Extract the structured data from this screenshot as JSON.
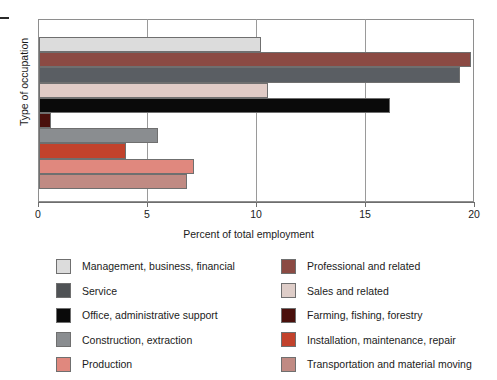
{
  "chart_data": {
    "type": "bar",
    "orientation": "horizontal",
    "title": "",
    "xlabel": "Percent of total employment",
    "ylabel": "Type of occupation",
    "xlim": [
      0,
      20
    ],
    "xticks": [
      "0",
      "5",
      "10",
      "15",
      "20"
    ],
    "grid": true,
    "grid_axis": "x",
    "legend_position": "bottom",
    "categories": [
      "Management, business, financial",
      "Professional and related",
      "Service",
      "Sales and related",
      "Office, administrative support",
      "Farming, fishing, forestry",
      "Construction, extraction",
      "Installation, maintenance, repair",
      "Production",
      "Transportation and material moving"
    ],
    "values": [
      10.2,
      19.8,
      19.3,
      10.5,
      16.1,
      0.55,
      5.45,
      4.0,
      7.1,
      6.8
    ],
    "colors": [
      "#dcdcdc",
      "#8b4a43",
      "#5a5e63",
      "#e0cbc6",
      "#0a0a0a",
      "#4a100c",
      "#8a8d90",
      "#c2422c",
      "#e0887e",
      "#c08a83"
    ]
  },
  "axes": {
    "x_title": "Percent of total employment",
    "y_title": "Type of occupation",
    "ticks": [
      {
        "label": "0",
        "value": 0
      },
      {
        "label": "5",
        "value": 5
      },
      {
        "label": "10",
        "value": 10
      },
      {
        "label": "15",
        "value": 15
      },
      {
        "label": "20",
        "value": 20
      }
    ]
  },
  "legend": {
    "columns": [
      {
        "items": [
          {
            "label": "Management, business, financial",
            "color": "#dcdcdc"
          },
          {
            "label": "Service",
            "color": "#4f5255"
          },
          {
            "label": "Office, administrative support",
            "color": "#0a0a0a"
          },
          {
            "label": "Construction, extraction",
            "color": "#8a8d90"
          },
          {
            "label": "Production",
            "color": "#e0887e"
          }
        ]
      },
      {
        "items": [
          {
            "label": "Professional and related",
            "color": "#8b4a43"
          },
          {
            "label": "Sales and related",
            "color": "#decdc8"
          },
          {
            "label": "Farming, fishing, forestry",
            "color": "#4a100c"
          },
          {
            "label": "Installation, maintenance, repair",
            "color": "#c2422c"
          },
          {
            "label": "Transportation and material moving",
            "color": "#c08a83"
          }
        ]
      }
    ]
  }
}
